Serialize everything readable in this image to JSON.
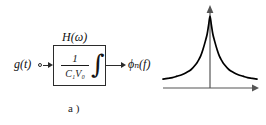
{
  "figure": {
    "panel_a": {
      "transfer_function_label": "H(ω)",
      "block_numerator": "1",
      "block_denominator": "C₁V₀",
      "block_operator": "∫",
      "input_label": "g(t)",
      "output_label": "ϕₙ(f)",
      "caption": "a )"
    },
    "panel_b": {
      "curve_label": "Sϕₙ(f)",
      "origin_label": "0",
      "x_axis_label": "f",
      "caption": "b )"
    }
  },
  "chart_data": {
    "type": "line",
    "title": "",
    "xlabel": "f",
    "ylabel": "Sϕₙ(f)",
    "legend": [
      "Sϕₙ(f)"
    ],
    "grid": false,
    "legend_position": "upper-left",
    "xlim": [
      -1,
      1
    ],
    "ylim": [
      0,
      1
    ],
    "tick_labels": {
      "x": [
        "0"
      ],
      "y": []
    },
    "annotations": [
      "Power spectral density peaks sharply at f = 0, symmetric 1/|f| decay"
    ],
    "series": [
      {
        "name": "Sϕₙ(f)",
        "x": [
          -1.0,
          -0.9,
          -0.8,
          -0.7,
          -0.6,
          -0.5,
          -0.4,
          -0.3,
          -0.25,
          -0.2,
          -0.15,
          -0.1,
          -0.06,
          -0.03,
          0.0,
          0.03,
          0.06,
          0.1,
          0.15,
          0.2,
          0.25,
          0.3,
          0.4,
          0.5,
          0.6,
          0.7,
          0.8,
          0.9,
          1.0
        ],
        "values": [
          0.12,
          0.13,
          0.14,
          0.16,
          0.18,
          0.21,
          0.25,
          0.32,
          0.37,
          0.43,
          0.52,
          0.63,
          0.73,
          0.85,
          0.97,
          0.85,
          0.73,
          0.63,
          0.52,
          0.43,
          0.37,
          0.32,
          0.25,
          0.21,
          0.18,
          0.16,
          0.14,
          0.13,
          0.12
        ]
      }
    ]
  },
  "colors": {
    "ink": "#1a1a1a",
    "line": "#2b2b2b",
    "axis": "#555555",
    "curve": "#000000",
    "background": "#ffffff"
  }
}
